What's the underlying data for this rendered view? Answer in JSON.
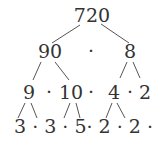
{
  "diagram": {
    "type": "factor-tree",
    "root": "720",
    "level1": {
      "left": "90",
      "op": "·",
      "right": "8"
    },
    "level2": {
      "a": "9",
      "op1": "·",
      "b": "10",
      "op2": "·",
      "c": "4",
      "op3": "·",
      "d": "2"
    },
    "level3": {
      "text": "3 · 3 · 5· 2 · 2 · 2"
    },
    "text_color": "#333333",
    "line_color": "#555555"
  }
}
